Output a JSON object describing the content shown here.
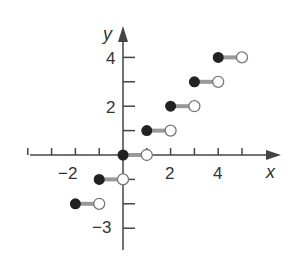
{
  "chart_data": {
    "type": "step",
    "title": "",
    "xlabel": "x",
    "ylabel": "y",
    "x_ticks": [
      -4,
      -3,
      -2,
      -1,
      0,
      1,
      2,
      3,
      4,
      5
    ],
    "x_tick_labels": [
      {
        "value": -2,
        "label": "−2"
      },
      {
        "value": 2,
        "label": "2"
      },
      {
        "value": 4,
        "label": "4"
      }
    ],
    "y_ticks": [
      -3,
      -2,
      -1,
      1,
      2,
      3,
      4
    ],
    "y_tick_labels": [
      {
        "value": 4,
        "label": "4"
      },
      {
        "value": 2,
        "label": "2"
      },
      {
        "value": -3,
        "label": "−3"
      }
    ],
    "function": "floor(x)",
    "segments": [
      {
        "x_start": -2,
        "x_end": -1,
        "y": -2,
        "start_closed": true,
        "end_closed": false
      },
      {
        "x_start": -1,
        "x_end": 0,
        "y": -1,
        "start_closed": true,
        "end_closed": false
      },
      {
        "x_start": 0,
        "x_end": 1,
        "y": 0,
        "start_closed": true,
        "end_closed": false
      },
      {
        "x_start": 1,
        "x_end": 2,
        "y": 1,
        "start_closed": true,
        "end_closed": false
      },
      {
        "x_start": 2,
        "x_end": 3,
        "y": 2,
        "start_closed": true,
        "end_closed": false
      },
      {
        "x_start": 3,
        "x_end": 4,
        "y": 3,
        "start_closed": true,
        "end_closed": false
      },
      {
        "x_start": 4,
        "x_end": 5,
        "y": 4,
        "start_closed": true,
        "end_closed": false
      }
    ],
    "xlim": [
      -4,
      5.5
    ],
    "ylim": [
      -4,
      5
    ],
    "grid": false,
    "colors": {
      "axis": "#444444",
      "segment": "#999999",
      "closed_point": "#222222",
      "open_point": "#ffffff"
    }
  },
  "labels": {
    "x_axis": "x",
    "y_axis": "y",
    "xm2": "−2",
    "x2": "2",
    "x4": "4",
    "y4": "4",
    "y2": "2",
    "ym3": "−3"
  }
}
